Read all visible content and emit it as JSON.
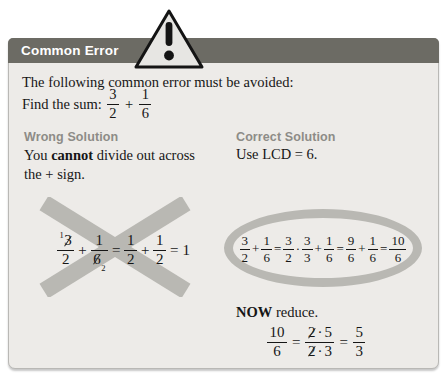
{
  "colors": {
    "header_bg": "#6c6b64",
    "box_bg": "#edebe8",
    "box_border": "#b9b8b5",
    "heading_gray": "#8d8c87",
    "mark_gray": "#b9b8b3",
    "triangle_fill": "#e7e6e3",
    "text": "#161616"
  },
  "header": {
    "title": "Common Error",
    "icon": "warning-triangle-exclamation"
  },
  "intro": {
    "line1": "The following common error must be avoided:",
    "find_prefix": "Find the sum:",
    "sum": {
      "f1_num": "3",
      "f1_den": "2",
      "plus": "+",
      "f2_num": "1",
      "f2_den": "6"
    }
  },
  "wrong": {
    "heading": "Wrong Solution",
    "body": {
      "pre": "You ",
      "bold": "cannot",
      "post": " divide out across",
      "line2": "the + sign."
    },
    "expr": {
      "t1_sup": "1",
      "t1_num": "3",
      "t1_den": "2",
      "op1": "+",
      "t2_num": "1",
      "t2_den": "6",
      "t2_sub": "2",
      "op2": "=",
      "t3_num": "1",
      "t3_den": "2",
      "op3": "+",
      "t4_num": "1",
      "t4_den": "2",
      "op4": "=",
      "result": "1"
    }
  },
  "correct": {
    "heading": "Correct Solution",
    "body": "Use LCD = 6.",
    "expr": {
      "f1_num": "3",
      "f1_den": "2",
      "op1": "+",
      "f2_num": "1",
      "f2_den": "6",
      "op2": "=",
      "f3_num": "3",
      "f3_den": "2",
      "op3": "·",
      "f4_num": "3",
      "f4_den": "3",
      "op4": "+",
      "f5_num": "1",
      "f5_den": "6",
      "op5": "=",
      "f6_num": "9",
      "f6_den": "6",
      "op6": "+",
      "f7_num": "1",
      "f7_den": "6",
      "op7": "=",
      "f8_num": "10",
      "f8_den": "6"
    }
  },
  "reduce": {
    "bold": "NOW",
    "rest": " reduce.",
    "expr": {
      "f1_num": "10",
      "f1_den": "6",
      "op1": "=",
      "f2_num_a": "2",
      "f2_num_dot": "·",
      "f2_num_b": "5",
      "f2_den_a": "2",
      "f2_den_dot": "·",
      "f2_den_b": "3",
      "op2": "=",
      "f3_num": "5",
      "f3_den": "3"
    }
  }
}
